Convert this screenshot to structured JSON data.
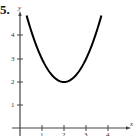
{
  "problem_number": "5.",
  "chart_data": {
    "type": "line",
    "title": "",
    "xlabel": "x",
    "ylabel": "y",
    "function": "y = (x - 2)^2 + 2",
    "x": [
      0.3,
      0.5,
      1.0,
      1.5,
      2.0,
      2.5,
      3.0,
      3.5,
      3.7
    ],
    "values": [
      4.89,
      4.25,
      3.0,
      2.25,
      2.0,
      2.25,
      3.0,
      4.25,
      4.89
    ],
    "x_ticks": [
      "1",
      "2",
      "3",
      "4"
    ],
    "y_ticks": [
      "1",
      "2",
      "3",
      "4"
    ],
    "xlim": [
      -0.2,
      5
    ],
    "ylim": [
      -0.3,
      5.2
    ],
    "grid": false,
    "vertex": [
      2,
      2
    ],
    "axis_color": "#444444",
    "curve_color": "#000000"
  }
}
